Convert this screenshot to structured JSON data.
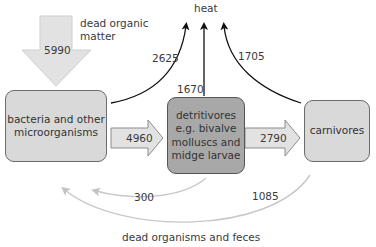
{
  "diagram": {
    "nodes": {
      "bacteria": {
        "lines": [
          "bacteria and other",
          "microorganisms"
        ]
      },
      "detritivores": {
        "lines": [
          "detritivores",
          "e.g. bivalve",
          "molluscs and",
          "midge larvae"
        ]
      },
      "carnivores": {
        "lines": [
          "carnivores"
        ]
      }
    },
    "labels": {
      "heat": "heat",
      "dead_organic_matter": [
        "dead organic",
        "matter"
      ],
      "dead_organisms_feces": "dead organisms and feces"
    },
    "flows": {
      "input_dead_organic_matter": "5990",
      "bacteria_to_detritivores": "4960",
      "detritivores_to_carnivores": "2790",
      "bacteria_heat": "2625",
      "detritivores_heat": "1670",
      "carnivores_heat": "1705",
      "detritivores_return": "300",
      "carnivores_return": "1085"
    },
    "colors": {
      "light_box": "#d9d9d9",
      "dark_box": "#a8a8a8",
      "arrow_fill": "#e2e2e2",
      "return_arrow": "#c8c8c8",
      "heat_arrow": "#111111"
    }
  }
}
